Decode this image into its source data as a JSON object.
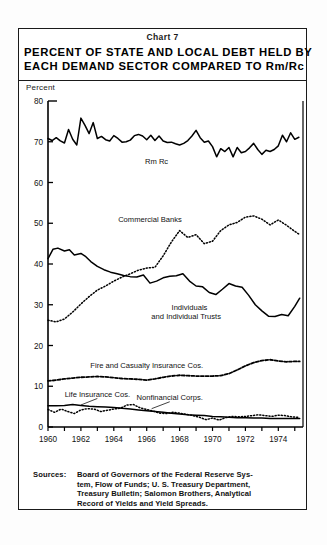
{
  "chart_number": "Chart 7",
  "title": {
    "line1": "PERCENT OF STATE AND LOCAL DEBT HELD BY",
    "line2": "EACH DEMAND SECTOR COMPARED TO Rm/Rc"
  },
  "axis_unit_label": "Percent",
  "sources": {
    "label": "Sources:",
    "line1": "Board of Governors of the Federal Reserve Sys-",
    "line2": "tem, Flow of Funds; U. S. Treasury Department,",
    "line3": "Treasury Bulletin; Salomon Brothers, Analytical",
    "line4": "Record of Yields and Yield Spreads."
  },
  "colors": {
    "ink": "#000000",
    "frame": "#1a1a1a",
    "paper": "#ffffff"
  },
  "chart_data": {
    "type": "line",
    "title": "PERCENT OF STATE AND LOCAL DEBT HELD BY EACH DEMAND SECTOR COMPARED TO Rm/Rc",
    "xlabel": "",
    "ylabel": "Percent",
    "xlim": [
      1960,
      1975.5
    ],
    "ylim": [
      0,
      80
    ],
    "yticks": [
      0,
      10,
      20,
      30,
      40,
      50,
      60,
      70,
      80
    ],
    "ytick_labels": [
      "0",
      "10",
      "20",
      "30",
      "40",
      "50",
      "60",
      "70",
      "80"
    ],
    "xticks": [
      1960,
      1961,
      1962,
      1963,
      1964,
      1965,
      1966,
      1967,
      1968,
      1969,
      1970,
      1971,
      1972,
      1973,
      1974,
      1975
    ],
    "xtick_labels": [
      "1960",
      "",
      "1962",
      "",
      "1964",
      "",
      "1966",
      "",
      "1968",
      "",
      "1970",
      "",
      "1972",
      "",
      "1974",
      ""
    ],
    "grid": false,
    "legend_position": "inline-annotations",
    "annotations": [
      {
        "text": "Rm Rc",
        "x": 1966.6,
        "y": 64.5
      },
      {
        "text": "Commercial Banks",
        "x": 1966.2,
        "y": 50.4
      },
      {
        "text": "Individuals",
        "x": 1968.6,
        "y": 28.6
      },
      {
        "text": "and Individual Trusts",
        "x": 1968.4,
        "y": 26.4
      },
      {
        "text": "Fire and Casualty Insurance Cos.",
        "x": 1966.0,
        "y": 14.4
      },
      {
        "text": "Life Insurance Cos.",
        "x": 1963.0,
        "y": 7.4
      },
      {
        "text": "Nonfinancial Corps.",
        "x": 1967.4,
        "y": 6.6
      }
    ],
    "series": [
      {
        "name": "Rm Rc",
        "style": "solid",
        "x": [
          1960.0,
          1960.25,
          1960.5,
          1960.75,
          1961.0,
          1961.25,
          1961.5,
          1961.75,
          1962.0,
          1962.25,
          1962.5,
          1962.75,
          1963.0,
          1963.25,
          1963.5,
          1963.75,
          1964.0,
          1964.25,
          1964.5,
          1964.75,
          1965.0,
          1965.25,
          1965.5,
          1965.75,
          1966.0,
          1966.25,
          1966.5,
          1966.75,
          1967.0,
          1967.25,
          1967.5,
          1967.75,
          1968.0,
          1968.25,
          1968.5,
          1968.75,
          1969.0,
          1969.25,
          1969.5,
          1969.75,
          1970.0,
          1970.25,
          1970.5,
          1970.75,
          1971.0,
          1971.25,
          1971.5,
          1971.75,
          1972.0,
          1972.25,
          1972.5,
          1972.75,
          1973.0,
          1973.25,
          1973.5,
          1973.75,
          1974.0,
          1974.25,
          1974.5,
          1974.75,
          1975.0,
          1975.25
        ],
        "values": [
          70.8,
          70.3,
          71.0,
          70.2,
          69.7,
          73.0,
          70.6,
          69.2,
          75.8,
          74.0,
          72.0,
          74.7,
          70.8,
          71.3,
          70.5,
          70.2,
          71.5,
          70.8,
          69.9,
          70.0,
          70.4,
          71.5,
          71.8,
          71.4,
          70.5,
          71.6,
          70.3,
          71.4,
          70.2,
          69.8,
          69.9,
          69.5,
          69.2,
          69.6,
          70.3,
          71.4,
          72.8,
          71.0,
          69.9,
          70.2,
          68.8,
          66.3,
          68.3,
          67.6,
          68.6,
          66.3,
          68.6,
          67.3,
          67.6,
          68.5,
          69.6,
          68.1,
          66.9,
          67.9,
          67.6,
          68.1,
          69.0,
          71.6,
          70.0,
          72.2,
          70.6,
          71.1
        ]
      },
      {
        "name": "Commercial Banks",
        "style": "dotted",
        "x": [
          1960.0,
          1960.5,
          1961.0,
          1961.5,
          1962.0,
          1962.5,
          1963.0,
          1963.5,
          1964.0,
          1964.5,
          1965.0,
          1965.5,
          1966.0,
          1966.5,
          1967.0,
          1967.5,
          1968.0,
          1968.5,
          1969.0,
          1969.5,
          1970.0,
          1970.5,
          1971.0,
          1971.5,
          1972.0,
          1972.5,
          1973.0,
          1973.5,
          1974.0,
          1974.5,
          1975.0,
          1975.3
        ],
        "values": [
          26.2,
          25.8,
          26.5,
          28.2,
          30.2,
          32.0,
          33.6,
          34.6,
          35.8,
          36.8,
          37.6,
          38.5,
          39.0,
          39.2,
          42.0,
          45.4,
          48.2,
          46.5,
          47.2,
          45.0,
          45.6,
          48.2,
          49.6,
          50.2,
          51.5,
          51.8,
          51.0,
          49.6,
          50.8,
          49.5,
          48.0,
          47.2
        ]
      },
      {
        "name": "Individuals and Individual Trusts",
        "style": "solid",
        "x": [
          1960.0,
          1960.3,
          1960.6,
          1961.0,
          1961.3,
          1961.6,
          1962.0,
          1962.3,
          1962.6,
          1963.0,
          1963.4,
          1963.8,
          1964.2,
          1964.6,
          1965.0,
          1965.4,
          1965.8,
          1966.2,
          1966.6,
          1967.0,
          1967.4,
          1967.8,
          1968.2,
          1968.6,
          1969.0,
          1969.4,
          1969.8,
          1970.2,
          1970.6,
          1971.0,
          1971.4,
          1971.8,
          1972.2,
          1972.6,
          1973.0,
          1973.4,
          1973.8,
          1974.2,
          1974.6,
          1975.0,
          1975.3
        ],
        "values": [
          41.3,
          43.6,
          43.9,
          43.2,
          43.5,
          42.2,
          42.6,
          41.8,
          40.6,
          39.4,
          38.6,
          38.0,
          37.6,
          37.2,
          36.9,
          36.8,
          37.3,
          35.3,
          35.8,
          36.6,
          37.0,
          37.1,
          37.6,
          35.8,
          34.6,
          34.4,
          33.0,
          32.5,
          33.8,
          35.2,
          34.6,
          34.3,
          32.3,
          30.0,
          28.5,
          27.2,
          27.1,
          27.6,
          27.3,
          29.6,
          31.6
        ]
      },
      {
        "name": "Fire and Casualty Insurance Cos.",
        "style": "dashed",
        "x": [
          1960.0,
          1960.5,
          1961.0,
          1961.5,
          1962.0,
          1962.5,
          1963.0,
          1963.5,
          1964.0,
          1964.5,
          1965.0,
          1965.5,
          1966.0,
          1966.5,
          1967.0,
          1967.5,
          1968.0,
          1968.5,
          1969.0,
          1969.5,
          1970.0,
          1970.5,
          1971.0,
          1971.5,
          1972.0,
          1972.5,
          1973.0,
          1973.5,
          1974.0,
          1974.5,
          1975.0,
          1975.3
        ],
        "values": [
          11.3,
          11.5,
          11.8,
          12.0,
          12.2,
          12.3,
          12.4,
          12.3,
          12.1,
          11.9,
          11.8,
          11.7,
          11.5,
          11.8,
          12.2,
          12.5,
          12.7,
          12.6,
          12.5,
          12.5,
          12.5,
          12.6,
          13.1,
          14.0,
          15.0,
          15.8,
          16.3,
          16.5,
          16.2,
          16.0,
          16.1,
          16.1
        ]
      },
      {
        "name": "Life Insurance Cos.",
        "style": "solid",
        "x": [
          1960.0,
          1960.5,
          1961.0,
          1961.5,
          1962.0,
          1962.5,
          1963.0,
          1963.5,
          1964.0,
          1964.5,
          1965.0,
          1965.5,
          1966.0,
          1966.5,
          1967.0,
          1967.5,
          1968.0,
          1968.5,
          1969.0,
          1969.5,
          1970.0,
          1970.5,
          1971.0,
          1971.5,
          1972.0,
          1972.5,
          1973.0,
          1973.5,
          1974.0,
          1974.5,
          1975.0,
          1975.3
        ],
        "values": [
          5.2,
          5.2,
          5.3,
          5.5,
          5.3,
          5.1,
          5.0,
          4.9,
          4.8,
          4.6,
          4.4,
          4.2,
          4.0,
          3.8,
          3.6,
          3.4,
          3.2,
          3.0,
          2.9,
          2.8,
          2.6,
          2.5,
          2.4,
          2.3,
          2.3,
          2.2,
          2.2,
          2.1,
          2.1,
          2.1,
          2.1,
          2.1
        ]
      },
      {
        "name": "Nonfinancial Corps.",
        "style": "dotted",
        "x": [
          1960.0,
          1960.4,
          1960.8,
          1961.2,
          1961.6,
          1962.0,
          1962.4,
          1962.8,
          1963.2,
          1963.6,
          1964.0,
          1964.4,
          1964.8,
          1965.2,
          1965.6,
          1966.0,
          1966.4,
          1966.8,
          1967.2,
          1967.6,
          1968.0,
          1968.4,
          1968.8,
          1969.2,
          1969.6,
          1970.0,
          1970.4,
          1970.8,
          1971.2,
          1971.6,
          1972.0,
          1972.4,
          1972.8,
          1973.2,
          1973.6,
          1974.0,
          1974.4,
          1974.8,
          1975.2
        ],
        "values": [
          4.3,
          3.6,
          4.4,
          3.8,
          3.3,
          4.2,
          4.5,
          4.4,
          3.8,
          4.1,
          4.4,
          4.6,
          5.4,
          5.5,
          4.7,
          4.3,
          3.9,
          3.4,
          3.3,
          3.6,
          3.4,
          3.1,
          2.8,
          2.4,
          1.8,
          2.2,
          1.7,
          2.3,
          2.6,
          2.5,
          2.6,
          2.8,
          3.0,
          2.8,
          2.6,
          2.9,
          2.8,
          2.5,
          2.4
        ]
      }
    ]
  }
}
